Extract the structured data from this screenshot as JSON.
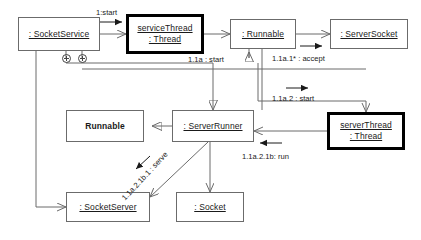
{
  "diagram": {
    "type": "uml-collaboration-diagram",
    "title": "",
    "line_color": "#6b6b6b",
    "active_border_color": "#000000",
    "text_color": "#1a1a1a",
    "background": "#ffffff",
    "nodes": [
      {
        "id": "socketservice",
        "label": ": SocketService",
        "style": "instance",
        "active": false,
        "x": 18,
        "y": 17,
        "w": 82,
        "h": 34
      },
      {
        "id": "servicethread",
        "label_line1": "serviceThread",
        "label_line2": ": Thread",
        "style": "instance-two-line",
        "active": true,
        "x": 126,
        "y": 14,
        "w": 78,
        "h": 40
      },
      {
        "id": "runnable_instance",
        "label": ": Runnable",
        "style": "instance",
        "active": false,
        "x": 230,
        "y": 19,
        "w": 66,
        "h": 30
      },
      {
        "id": "serversocket",
        "label": ": ServerSocket",
        "style": "instance",
        "active": false,
        "x": 330,
        "y": 19,
        "w": 78,
        "h": 30
      },
      {
        "id": "runnable_class",
        "label": "Runnable",
        "style": "class",
        "active": false,
        "x": 66,
        "y": 110,
        "w": 78,
        "h": 32
      },
      {
        "id": "serverrunner",
        "label": ": ServerRunner",
        "style": "instance",
        "active": false,
        "x": 172,
        "y": 110,
        "w": 82,
        "h": 32
      },
      {
        "id": "serverthread",
        "label_line1": "serverThread",
        "label_line2": ": Thread",
        "style": "instance-two-line",
        "active": true,
        "x": 327,
        "y": 112,
        "w": 78,
        "h": 38
      },
      {
        "id": "socketserver",
        "label": ": SocketServer",
        "style": "instance",
        "active": false,
        "x": 66,
        "y": 192,
        "w": 84,
        "h": 30
      },
      {
        "id": "socket",
        "label": ": Socket",
        "style": "instance",
        "active": false,
        "x": 176,
        "y": 192,
        "w": 68,
        "h": 30
      }
    ],
    "messages": [
      {
        "id": "m1",
        "label": "1:start",
        "from": "socketservice",
        "to": "servicethread",
        "x": 96,
        "y": 8
      },
      {
        "id": "m2",
        "label": "1.1a : start",
        "from": "servicethread",
        "to": "runnable_instance",
        "x": 188,
        "y": 55
      },
      {
        "id": "m3",
        "label": "1.1a.1* : accept",
        "from": "runnable_instance",
        "to": "serversocket",
        "x": 272,
        "y": 54
      },
      {
        "id": "m4",
        "label": "1.1a.2 : start",
        "from": "runnable_instance",
        "to": "serverthread",
        "x": 272,
        "y": 94
      },
      {
        "id": "m5",
        "label": "1.1a.2.1b: run",
        "from": "serverthread",
        "to": "serverrunner",
        "x": 242,
        "y": 152
      },
      {
        "id": "m6",
        "label": "1.1a.2.1b.1 : serve",
        "from": "serverrunner",
        "to": "socketserver",
        "x": 120,
        "y": 196,
        "rotate": -47
      }
    ],
    "creation_markers": [
      {
        "id": "plus-left",
        "symbol": "circle-plus",
        "x": 62,
        "y": 54
      },
      {
        "id": "plus-right",
        "symbol": "circle-plus",
        "x": 78,
        "y": 54
      }
    ]
  }
}
